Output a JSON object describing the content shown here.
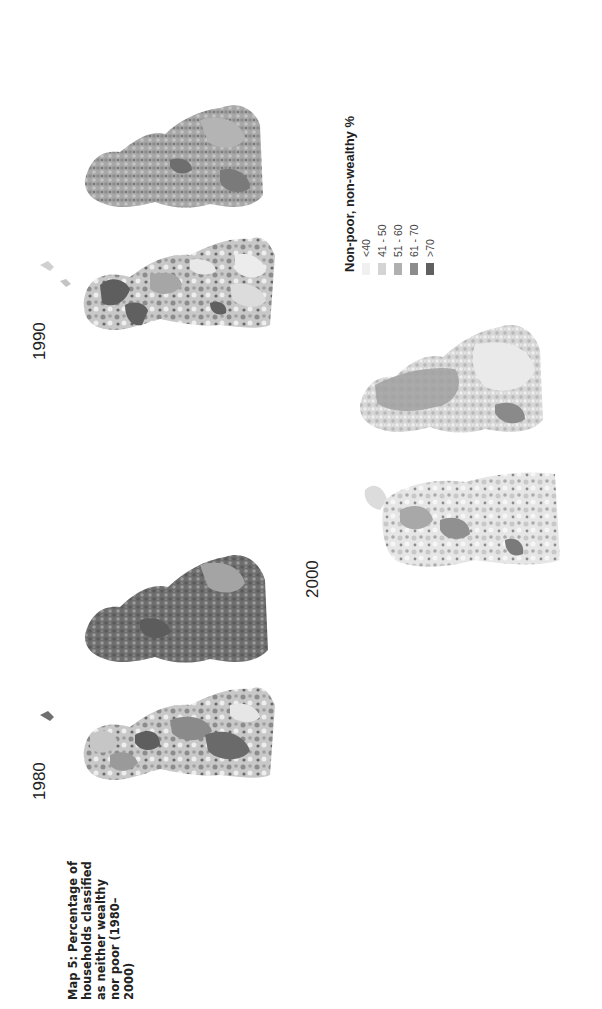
{
  "caption": {
    "lines": [
      "Map 5: Percentage of",
      "households classified",
      "as neither wealthy",
      "nor poor (1980–",
      "2000)"
    ],
    "text": "Map 5: Percentage of households classified as neither wealthy nor poor (1980–2000)"
  },
  "panels": [
    {
      "year": "1980",
      "label": "1980"
    },
    {
      "year": "1990",
      "label": "1990"
    },
    {
      "year": "2000",
      "label": "2000"
    }
  ],
  "legend": {
    "title": "Non-poor, non-wealthy %",
    "items": [
      {
        "label": "<40",
        "color": "#f0f0f0"
      },
      {
        "label": "41 - 50",
        "color": "#d4d4d4"
      },
      {
        "label": "51 - 60",
        "color": "#b0b0b0"
      },
      {
        "label": "61 - 70",
        "color": "#8c8c8c"
      },
      {
        "label": ">70",
        "color": "#606060"
      }
    ]
  },
  "colors": {
    "c1": "#f0f0f0",
    "c2": "#d4d4d4",
    "c3": "#b0b0b0",
    "c4": "#8c8c8c",
    "c5": "#606060"
  }
}
